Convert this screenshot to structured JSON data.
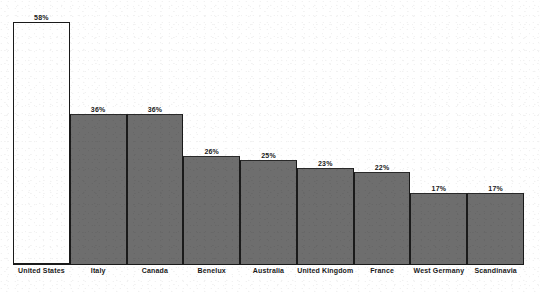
{
  "chart_data": {
    "type": "bar",
    "title": "",
    "subtitle": "",
    "xlabel": "",
    "ylabel": "",
    "ylim": [
      0,
      58
    ],
    "grid": false,
    "legend": false,
    "value_suffix": "%",
    "categories": [
      "United States",
      "Italy",
      "Canada",
      "Benelux",
      "Australia",
      "United Kingdom",
      "France",
      "West Germany",
      "Scandinavia"
    ],
    "values": [
      58,
      36,
      36,
      26,
      25,
      23,
      22,
      17,
      17
    ],
    "value_labels": [
      "58%",
      "36%",
      "36%",
      "26%",
      "25%",
      "23%",
      "22%",
      "17%",
      "17%"
    ],
    "highlight_index": 0,
    "colors": {
      "bar_fill": "#6e6e6e",
      "highlight_fill": "#ffffff",
      "bar_outline": "#1a1a1a",
      "axis": "#1a1a1a",
      "text": "#1a1a1a",
      "background": "#ffffff"
    }
  }
}
